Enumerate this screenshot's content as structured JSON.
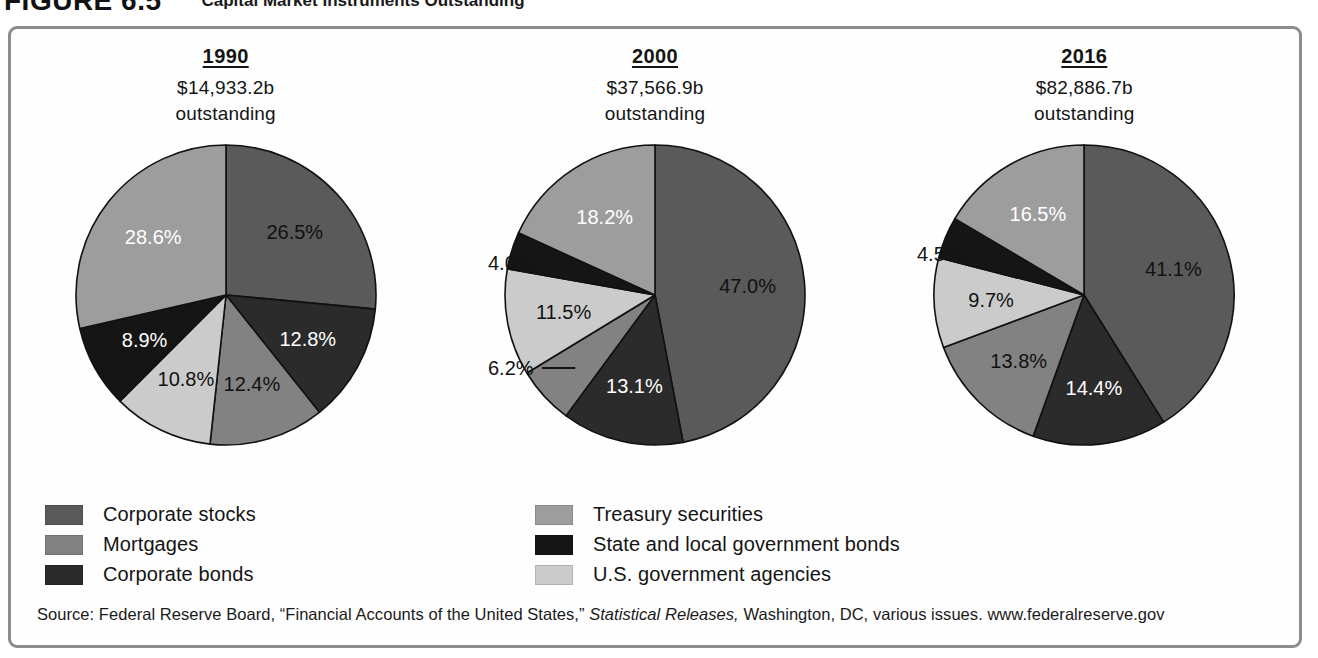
{
  "figure": {
    "label": "FIGURE 6.5",
    "title": "Capital Market Instruments Outstanding"
  },
  "source": {
    "prefix": "Source: Federal Reserve Board, “Financial Accounts of the United States,” ",
    "italic": "Statistical Releases,",
    "suffix": " Washington, DC, various issues. www.federalreserve.gov"
  },
  "legend": {
    "left_items": [
      {
        "label": "Corporate stocks",
        "color": "#5a5a5a"
      },
      {
        "label": "Mortgages",
        "color": "#828282"
      },
      {
        "label": "Corporate bonds",
        "color": "#2b2b2b"
      }
    ],
    "right_items": [
      {
        "label": "Treasury securities",
        "color": "#9d9d9d"
      },
      {
        "label": "State and local government bonds",
        "color": "#151515"
      },
      {
        "label": "U.S. government agencies",
        "color": "#cbcbcb"
      }
    ]
  },
  "chart_data": {
    "type": "pie",
    "title": "Capital Market Instruments Outstanding",
    "legend_position": "bottom",
    "categories": [
      "Corporate stocks",
      "Corporate bonds",
      "Mortgages",
      "U.S. government agencies",
      "State and local government bonds",
      "Treasury securities"
    ],
    "category_colors": {
      "Corporate stocks": "#5a5a5a",
      "Corporate bonds": "#2b2b2b",
      "Mortgages": "#828282",
      "U.S. government agencies": "#cbcbcb",
      "State and local government bonds": "#151515",
      "Treasury securities": "#9d9d9d"
    },
    "charts": [
      {
        "year": "1990",
        "amount": "$14,933.2b",
        "outstanding": "outstanding",
        "slices": [
          {
            "category": "Corporate stocks",
            "value": 26.5,
            "label": "26.5%",
            "color": "#5a5a5a",
            "label_color": "#111111",
            "callout": false
          },
          {
            "category": "Corporate bonds",
            "value": 12.8,
            "label": "12.8%",
            "color": "#2b2b2b",
            "label_color": "#ffffff",
            "callout": false
          },
          {
            "category": "Mortgages",
            "value": 12.4,
            "label": "12.4%",
            "color": "#828282",
            "label_color": "#111111",
            "callout": false
          },
          {
            "category": "U.S. government agencies",
            "value": 10.8,
            "label": "10.8%",
            "color": "#cbcbcb",
            "label_color": "#111111",
            "callout": false
          },
          {
            "category": "State and local government bonds",
            "value": 8.9,
            "label": "8.9%",
            "color": "#151515",
            "label_color": "#ffffff",
            "callout": false
          },
          {
            "category": "Treasury securities",
            "value": 28.6,
            "label": "28.6%",
            "color": "#9d9d9d",
            "label_color": "#ffffff",
            "callout": false
          }
        ]
      },
      {
        "year": "2000",
        "amount": "$37,566.9b",
        "outstanding": "outstanding",
        "slices": [
          {
            "category": "Corporate stocks",
            "value": 47.0,
            "label": "47.0%",
            "color": "#5a5a5a",
            "label_color": "#111111",
            "callout": false
          },
          {
            "category": "Corporate bonds",
            "value": 13.1,
            "label": "13.1%",
            "color": "#2b2b2b",
            "label_color": "#ffffff",
            "callout": false
          },
          {
            "category": "Mortgages",
            "value": 6.2,
            "label": "6.2%",
            "color": "#828282",
            "label_color": "#111111",
            "callout": true
          },
          {
            "category": "U.S. government agencies",
            "value": 11.5,
            "label": "11.5%",
            "color": "#cbcbcb",
            "label_color": "#111111",
            "callout": false
          },
          {
            "category": "State and local government bonds",
            "value": 4.0,
            "label": "4.0%",
            "color": "#151515",
            "label_color": "#111111",
            "callout": true
          },
          {
            "category": "Treasury securities",
            "value": 18.2,
            "label": "18.2%",
            "color": "#9d9d9d",
            "label_color": "#ffffff",
            "callout": false
          }
        ]
      },
      {
        "year": "2016",
        "amount": "$82,886.7b",
        "outstanding": "outstanding",
        "slices": [
          {
            "category": "Corporate stocks",
            "value": 41.1,
            "label": "41.1%",
            "color": "#5a5a5a",
            "label_color": "#111111",
            "callout": false
          },
          {
            "category": "Corporate bonds",
            "value": 14.4,
            "label": "14.4%",
            "color": "#2b2b2b",
            "label_color": "#ffffff",
            "callout": false
          },
          {
            "category": "Mortgages",
            "value": 13.8,
            "label": "13.8%",
            "color": "#828282",
            "label_color": "#111111",
            "callout": false
          },
          {
            "category": "U.S. government agencies",
            "value": 9.7,
            "label": "9.7%",
            "color": "#cbcbcb",
            "label_color": "#111111",
            "callout": false
          },
          {
            "category": "State and local government bonds",
            "value": 4.5,
            "label": "4.5%",
            "color": "#151515",
            "label_color": "#111111",
            "callout": true
          },
          {
            "category": "Treasury securities",
            "value": 16.5,
            "label": "16.5%",
            "color": "#9d9d9d",
            "label_color": "#ffffff",
            "callout": false
          }
        ]
      }
    ]
  }
}
